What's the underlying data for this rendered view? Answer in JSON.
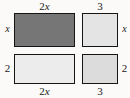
{
  "figure": {
    "type": "area-model-grid",
    "background_color": "#fbfaf8",
    "border_color": "#151515",
    "columns": [
      {
        "id": "col-left",
        "width_label": "2x"
      },
      {
        "id": "col-right",
        "width_label": "3"
      }
    ],
    "rows": [
      {
        "id": "row-top",
        "height_label": "x"
      },
      {
        "id": "row-bottom",
        "height_label": "2"
      }
    ],
    "tiles": [
      {
        "id": "top-left",
        "fill": "#767676",
        "shade": "dark",
        "width_label": "2x",
        "height_label": "x"
      },
      {
        "id": "top-right",
        "fill": "#e4e4e4",
        "shade": "very-light",
        "width_label": "3",
        "height_label": "x"
      },
      {
        "id": "bottom-left",
        "fill": "#ececec",
        "shade": "very-light",
        "width_label": "2x",
        "height_label": "2"
      },
      {
        "id": "bottom-right",
        "fill": "#dcdcdc",
        "shade": "light",
        "width_label": "3",
        "height_label": "2"
      }
    ],
    "labels": {
      "top_left_width": "2",
      "top_left_width_var": "x",
      "top_right_width": "3",
      "left_top_height": "x",
      "right_top_height": "x",
      "left_bottom_height": "2",
      "right_bottom_height": "2",
      "bottom_left_width": "2",
      "bottom_left_width_var": "x",
      "bottom_right_width": "3"
    }
  }
}
